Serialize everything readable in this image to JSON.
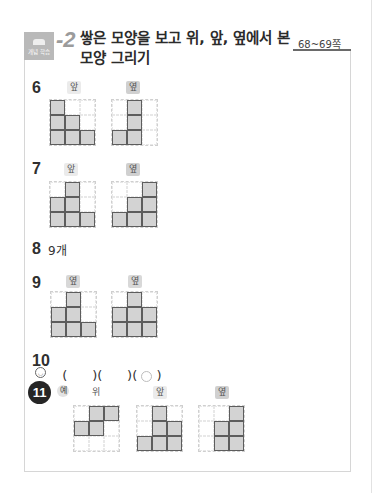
{
  "header": {
    "badge_label": "개념 학습",
    "section_number": "-2",
    "title_line1": "쌓은 모양을 보고 위, 앞, 옆에서 본",
    "title_line2": "모양 그리기",
    "page_range": "68~69쪽"
  },
  "problems": {
    "p6": {
      "number": "6",
      "views": [
        {
          "label": "앞",
          "grid": [
            [
              1,
              0,
              0
            ],
            [
              1,
              1,
              0
            ],
            [
              1,
              1,
              1
            ]
          ]
        },
        {
          "label": "옆",
          "grid": [
            [
              0,
              1,
              0
            ],
            [
              0,
              1,
              0
            ],
            [
              1,
              1,
              0
            ]
          ]
        }
      ]
    },
    "p7": {
      "number": "7",
      "views": [
        {
          "label": "앞",
          "grid": [
            [
              0,
              1,
              0
            ],
            [
              1,
              1,
              0
            ],
            [
              1,
              1,
              1
            ]
          ]
        },
        {
          "label": "옆",
          "grid": [
            [
              0,
              0,
              1
            ],
            [
              0,
              1,
              1
            ],
            [
              1,
              1,
              1
            ]
          ]
        }
      ]
    },
    "p8": {
      "number": "8",
      "answer": "9개"
    },
    "p9": {
      "number": "9",
      "views": [
        {
          "label": "옆",
          "grid": [
            [
              0,
              1,
              0
            ],
            [
              1,
              1,
              0
            ],
            [
              1,
              1,
              1
            ]
          ]
        },
        {
          "label": "옆",
          "grid": [
            [
              0,
              1,
              0
            ],
            [
              1,
              1,
              1
            ],
            [
              1,
              1,
              1
            ]
          ]
        }
      ]
    },
    "p10": {
      "number": "10",
      "choices": [
        "(      )",
        "(      )",
        "( ○ )"
      ],
      "selected_index": 2,
      "selected_mark": "○"
    },
    "p11": {
      "number": "11",
      "example_mark": "예",
      "hint_icon": "smiley-icon",
      "views": [
        {
          "label": "위",
          "grid": [
            [
              0,
              1,
              1
            ],
            [
              1,
              1,
              0
            ],
            [
              0,
              0,
              0
            ]
          ]
        },
        {
          "label": "앞",
          "grid": [
            [
              0,
              1,
              0
            ],
            [
              0,
              1,
              1
            ],
            [
              1,
              1,
              1
            ]
          ]
        },
        {
          "label": "옆",
          "grid": [
            [
              0,
              0,
              1
            ],
            [
              0,
              1,
              1
            ],
            [
              0,
              1,
              1
            ]
          ]
        }
      ]
    }
  },
  "colors": {
    "filled_cell": "#d3d3d3",
    "cell_border": "#5d5d5d",
    "badge_bg": "#b9b9b9",
    "number_circle_bg": "#262626"
  }
}
